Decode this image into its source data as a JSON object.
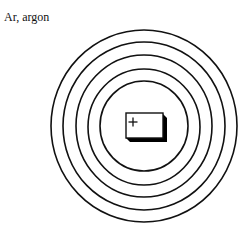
{
  "title": "Ar, argon",
  "diagram": {
    "type": "bohr-atom-model",
    "element_symbol": "Ar",
    "element_name": "argon",
    "nucleus_label": "+",
    "shell_count": 5,
    "colors": {
      "background": "#ffffff",
      "line": "#111111",
      "nucleus_fill": "#ffffff",
      "nucleus_shadow": "#000000"
    }
  }
}
